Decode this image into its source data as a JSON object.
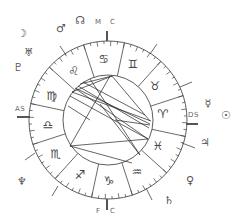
{
  "chart": {
    "type": "natal-astrology-wheel",
    "center": [
      108,
      120
    ],
    "outer_radius": 79,
    "inner_radius": 45,
    "aries_start_angle_deg": 348,
    "stroke_color": "#333333",
    "label_color": "#666666"
  },
  "angles": {
    "mc": {
      "text": "M",
      "text2": "C"
    },
    "ic": {
      "text": "F",
      "text2": "C"
    },
    "asc": {
      "text": "AS"
    },
    "dsc": {
      "text": "DS"
    }
  },
  "signs": [
    {
      "name": "aries",
      "glyph": "♈"
    },
    {
      "name": "taurus",
      "glyph": "♉"
    },
    {
      "name": "gemini",
      "glyph": "♊"
    },
    {
      "name": "cancer",
      "glyph": "♋"
    },
    {
      "name": "leo",
      "glyph": "♌"
    },
    {
      "name": "virgo",
      "glyph": "♍"
    },
    {
      "name": "libra",
      "glyph": "♎"
    },
    {
      "name": "scorpio",
      "glyph": "♏"
    },
    {
      "name": "sagittarius",
      "glyph": "♐"
    },
    {
      "name": "capricorn",
      "glyph": "♑"
    },
    {
      "name": "aquarius",
      "glyph": "♒"
    },
    {
      "name": "pisces",
      "glyph": "♓"
    }
  ],
  "planets": [
    {
      "name": "moon",
      "glyph": "☽"
    },
    {
      "name": "mars",
      "glyph": "♂"
    },
    {
      "name": "north-node",
      "glyph": "☊"
    },
    {
      "name": "uranus",
      "glyph": "♅"
    },
    {
      "name": "pluto",
      "glyph": "♇"
    },
    {
      "name": "mercury",
      "glyph": "☿"
    },
    {
      "name": "sun",
      "glyph": "☉"
    },
    {
      "name": "jupiter",
      "glyph": "♃"
    },
    {
      "name": "venus",
      "glyph": "♀"
    },
    {
      "name": "saturn",
      "glyph": "♄"
    },
    {
      "name": "neptune",
      "glyph": "♆"
    }
  ]
}
